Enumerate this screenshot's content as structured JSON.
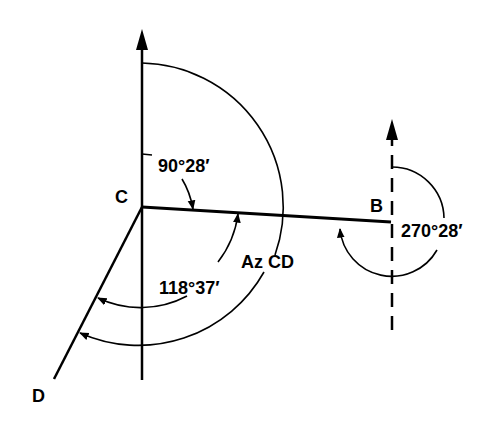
{
  "diagram": {
    "type": "survey-traverse-azimuth",
    "points": {
      "C": {
        "label": "C",
        "x": 142,
        "y": 207
      },
      "B": {
        "label": "B",
        "x": 391,
        "y": 222
      },
      "D": {
        "label": "D",
        "x": 54,
        "y": 379
      }
    },
    "labels": {
      "point_c": "C",
      "point_b": "B",
      "point_d": "D",
      "angle_c_azimuth_cb": "90°28′",
      "angle_c_deflection": "118°37′",
      "azimuth_cd": "Az CD",
      "angle_b_azimuth_bc": "270°28′"
    },
    "north_lines": [
      {
        "at": "C",
        "style": "solid"
      },
      {
        "at": "B",
        "style": "dashed"
      }
    ],
    "colors": {
      "line": "#000000",
      "background": "#ffffff"
    }
  }
}
